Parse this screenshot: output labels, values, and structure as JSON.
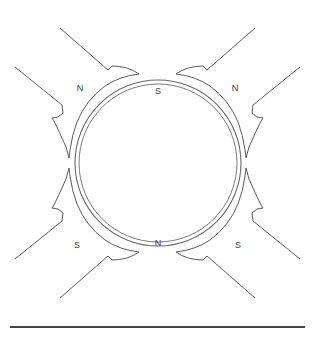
{
  "diagram": {
    "canvas": {
      "width": 315,
      "height": 340,
      "background": "#ffffff"
    },
    "line_color": "#555555",
    "label_color": "#3a3a3a",
    "armature": {
      "name": "armature-circle",
      "center_x": 158,
      "center_y": 163,
      "outer_radius": 83,
      "inner_radius": 79
    },
    "poles": [
      {
        "id": "top-left",
        "label": "N",
        "polarity": "north",
        "angle_deg": 135,
        "label_x": 80,
        "label_y": 89
      },
      {
        "id": "top-right",
        "label": "N",
        "polarity": "north",
        "angle_deg": 45,
        "label_x": 235,
        "label_y": 89
      },
      {
        "id": "bottom-left",
        "label": "S",
        "polarity": "south",
        "angle_deg": 225,
        "label_x": 77,
        "label_y": 246
      },
      {
        "id": "bottom-right",
        "label": "S",
        "polarity": "south",
        "angle_deg": 315,
        "label_x": 238,
        "label_y": 246
      }
    ],
    "armature_labels": [
      {
        "id": "top-gap",
        "label": "S",
        "label_x": 158,
        "label_y": 92
      },
      {
        "id": "bottom-gap",
        "label": "N",
        "label_x": 158,
        "label_y": 244
      }
    ],
    "baseline": {
      "name": "base-line",
      "x1": 10,
      "y1": 327,
      "x2": 305,
      "y2": 327,
      "color": "#444444"
    }
  }
}
